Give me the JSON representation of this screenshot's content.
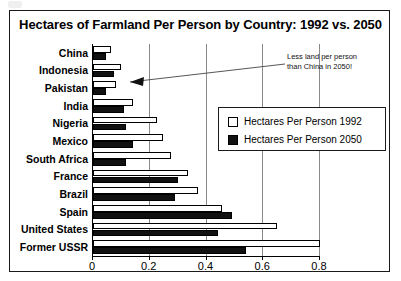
{
  "chart_data": {
    "type": "bar",
    "orientation": "horizontal",
    "title": "Hectares of Farmland Per Person by Country: 1992 vs. 2050",
    "xlabel": "",
    "ylabel": "",
    "xlim": [
      0,
      0.8
    ],
    "xticks": [
      "0",
      "0.2",
      "0.4",
      "0.6",
      "0.8"
    ],
    "xtick_values": [
      0,
      0.2,
      0.4,
      0.6,
      0.8
    ],
    "grid": true,
    "grid_axis": "x",
    "legend_position": "upper right",
    "categories": [
      "China",
      "Indonesia",
      "Pakistan",
      "India",
      "Nigeria",
      "Mexico",
      "South Africa",
      "France",
      "Brazil",
      "Spain",
      "United States",
      "Former USSR"
    ],
    "series": [
      {
        "name": "Hectares Per Person 1992",
        "color": "#ffffff",
        "values": [
          0.065,
          0.1,
          0.08,
          0.14,
          0.225,
          0.245,
          0.275,
          0.335,
          0.37,
          0.455,
          0.65,
          0.8
        ]
      },
      {
        "name": "Hectares Per Person 2050",
        "color": "#111111",
        "values": [
          0.045,
          0.075,
          0.045,
          0.11,
          0.115,
          0.14,
          0.115,
          0.3,
          0.29,
          0.49,
          0.44,
          0.54
        ]
      }
    ],
    "annotations": [
      {
        "name": "pakistan-callout",
        "lines": [
          "Less land per person",
          "than China in 2050!"
        ],
        "points_to": "Pakistan"
      }
    ]
  },
  "legend": {
    "items": [
      {
        "label": "Hectares Per Person 1992",
        "swatch": "white"
      },
      {
        "label": "Hectares Per Person 2050",
        "swatch": "black"
      }
    ]
  }
}
